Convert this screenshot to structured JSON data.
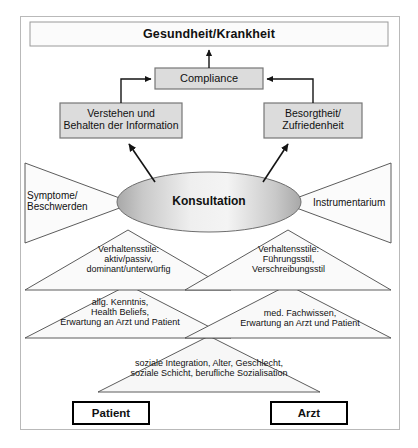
{
  "diagram": {
    "title": "Gesundheit/Krankheit",
    "frame": {
      "border_color": "#b9b9b9"
    },
    "colors": {
      "box_fill": "#d9d9d9",
      "box_border": "#808080",
      "title_fill": "#fbfbfb",
      "ellipse_fill_edge": "#b0b0b0",
      "ellipse_fill_center": "#f2f2f2",
      "triangle_border": "#4a4a4a",
      "arrow": "#1a1a1a",
      "bottom_box_border": "#000000"
    },
    "nodes": {
      "outcome": "Gesundheit/Krankheit",
      "compliance": "Compliance",
      "understanding": "Verstehen und\nBehalten der Information",
      "concern": "Besorgtheit/\nZufriedenheit",
      "consultation": "Konsultation",
      "symptoms": "Symptome/\nBeschwerden",
      "instruments": "Instrumentarium"
    },
    "layers": [
      {
        "name": "behaviour-styles",
        "left": "Verhaltensstile:\naktiv/passiv,\ndominant/unterwürfig",
        "right": "Verhaltensstile:\nFührungsstil,\nVerschreibungsstil"
      },
      {
        "name": "knowledge",
        "left": "allg. Kenntnis,\nHealth Beliefs,\nErwartung an Arzt und Patient",
        "right": "med. Fachwissen,\nErwartung an Arzt und Patient"
      }
    ],
    "shared_base": "soziale Integration, Alter, Geschlecht,\nsoziale Schicht, berufliche Sozialisation",
    "actors": {
      "left": "Patient",
      "right": "Arzt"
    }
  }
}
